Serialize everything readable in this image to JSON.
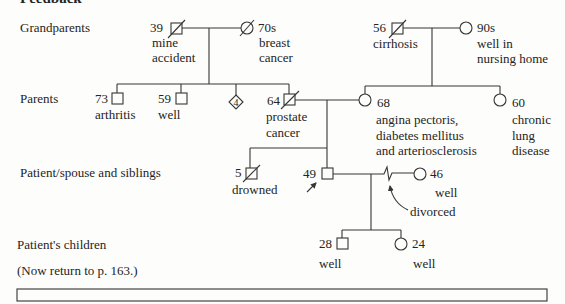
{
  "header": {
    "title": "Feedback"
  },
  "row_labels": {
    "grandparents": "Grandparents",
    "parents": "Parents",
    "patient_generation": "Patient/spouse and siblings",
    "children": "Patient's children"
  },
  "instruction": "(Now return to p. 163.)",
  "pedigree": {
    "grandparents": {
      "paternal_grandfather": {
        "sex": "male",
        "age": "39",
        "deceased": true,
        "notes": [
          "mine",
          "accident"
        ]
      },
      "paternal_grandmother": {
        "sex": "female",
        "age": "70s",
        "deceased": true,
        "notes": [
          "breast",
          "cancer"
        ]
      },
      "maternal_grandfather": {
        "sex": "male",
        "age": "56",
        "deceased": true,
        "notes": [
          "cirrhosis"
        ]
      },
      "maternal_grandmother": {
        "sex": "female",
        "age": "90s",
        "deceased": false,
        "notes": [
          "well in",
          "nursing home"
        ]
      }
    },
    "parents": {
      "paternal_uncle_1": {
        "sex": "male",
        "age": "73",
        "deceased": false,
        "notes": [
          "arthritis"
        ]
      },
      "paternal_uncle_2": {
        "sex": "male",
        "age": "59",
        "deceased": false,
        "notes": [
          "well"
        ]
      },
      "paternal_siblings_unspecified": {
        "sex": "unknown",
        "count": "4"
      },
      "father": {
        "sex": "male",
        "age": "64",
        "deceased": true,
        "notes": [
          "prostate",
          "cancer"
        ]
      },
      "mother": {
        "sex": "female",
        "age": "68",
        "deceased": false,
        "notes": [
          "angina pectoris,",
          "diabetes mellitus",
          "and arteriosclerosis"
        ]
      },
      "maternal_aunt": {
        "sex": "female",
        "age": "60",
        "deceased": false,
        "notes": [
          "chronic",
          "lung",
          "disease"
        ]
      }
    },
    "patient_generation": {
      "brother": {
        "sex": "male",
        "age": "5",
        "deceased": true,
        "notes": [
          "drowned"
        ]
      },
      "patient": {
        "sex": "male",
        "age": "49",
        "proband": true
      },
      "spouse": {
        "sex": "female",
        "age": "46",
        "deceased": false,
        "notes": [
          "well"
        ]
      },
      "relationship_note": "divorced"
    },
    "children": {
      "son": {
        "sex": "male",
        "age": "28",
        "deceased": false,
        "notes": [
          "well"
        ]
      },
      "daughter": {
        "sex": "female",
        "age": "24",
        "deceased": false,
        "notes": [
          "well"
        ]
      }
    }
  },
  "colors": {
    "background": "#fdfdfb",
    "line": "#363636",
    "text": "#242424"
  }
}
